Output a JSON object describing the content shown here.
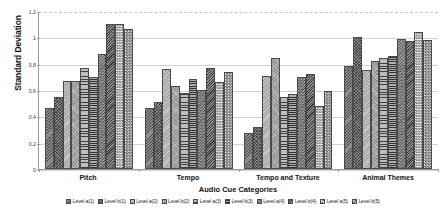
{
  "chart_data": {
    "type": "bar",
    "title": "",
    "xlabel": "Audio Cue Categories",
    "ylabel": "Standard Deviation",
    "categories": [
      "Pitch",
      "Tempo",
      "Tempo and Texture",
      "Animal Themes"
    ],
    "ylim": [
      0,
      1.2
    ],
    "yticks": [
      0,
      0.2,
      0.4,
      0.6,
      0.8,
      1,
      1.2
    ],
    "ytick_labels": [
      "0",
      "0.2",
      "0.4",
      "0.6",
      "0.8",
      "1",
      "1.2"
    ],
    "grid": true,
    "legend_position": "bottom",
    "series": [
      {
        "name": "Level a(1)",
        "pattern": "dark-diagonal-hatch",
        "values": [
          0.46,
          0.46,
          0.27,
          0.78
        ]
      },
      {
        "name": "Level b(1)",
        "pattern": "dark-checker",
        "values": [
          0.55,
          0.51,
          0.32,
          1.0
        ]
      },
      {
        "name": "Level a(2)",
        "pattern": "light-stipple",
        "values": [
          0.67,
          0.76,
          0.71,
          0.75
        ]
      },
      {
        "name": "Level b(2)",
        "pattern": "light-stipple-dots",
        "values": [
          0.67,
          0.63,
          0.84,
          0.82
        ]
      },
      {
        "name": "Level a(3)",
        "pattern": "horizontal-lines",
        "values": [
          0.77,
          0.58,
          0.55,
          0.84
        ]
      },
      {
        "name": "Level b(3)",
        "pattern": "horizontal-lines-dense",
        "values": [
          0.7,
          0.68,
          0.57,
          0.86
        ]
      },
      {
        "name": "Level a(4)",
        "pattern": "medium-diagonal-hatch",
        "values": [
          0.87,
          0.6,
          0.7,
          0.99
        ]
      },
      {
        "name": "Level b(4)",
        "pattern": "dark-diagonal-dense",
        "values": [
          1.1,
          0.77,
          0.72,
          0.97
        ]
      },
      {
        "name": "Level a(5)",
        "pattern": "checkerboard-light",
        "values": [
          1.1,
          0.66,
          0.48,
          1.04
        ]
      },
      {
        "name": "Level b(5)",
        "pattern": "checkerboard-dark",
        "values": [
          1.06,
          0.74,
          0.59,
          0.98
        ]
      }
    ]
  },
  "colors": {
    "axis": "#9a9a9a",
    "gridline": "#d2d2d2",
    "bar_outline": "#4a4a4a",
    "text": "#111111",
    "background": "#ffffff"
  }
}
